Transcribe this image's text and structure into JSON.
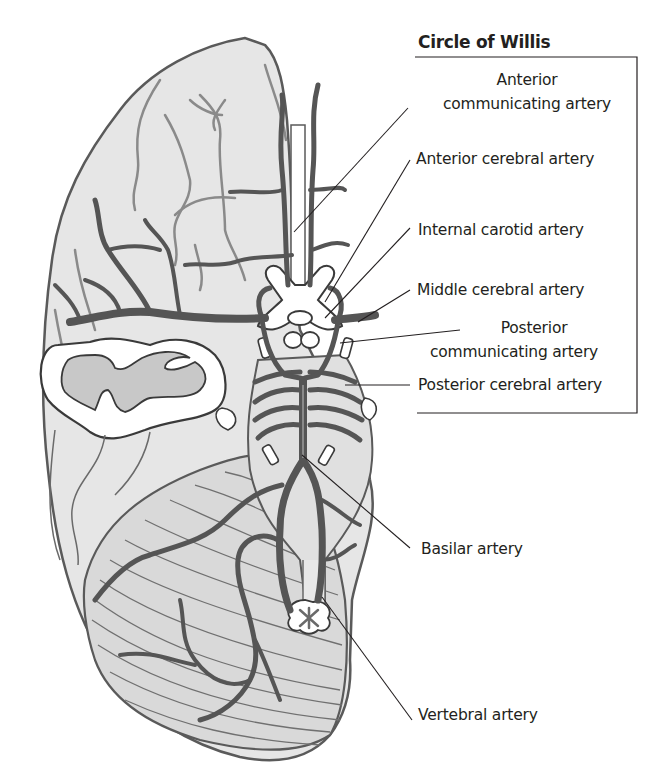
{
  "diagram": {
    "title": "Circle of Willis",
    "colors": {
      "brain_fill": "#e6e6e6",
      "brain_outline": "#5a5a5a",
      "artery_dark": "#555555",
      "artery_light": "#8a8a8a",
      "white_matter": "#ffffff",
      "gray_matter": "#c8c8c8",
      "leader_line": "#231f20"
    },
    "labels": [
      {
        "id": "anterior-communicating-artery",
        "line1": "Anterior",
        "line2": "communicating artery"
      },
      {
        "id": "anterior-cerebral-artery",
        "line1": "Anterior cerebral artery"
      },
      {
        "id": "internal-carotid-artery",
        "line1": "Internal carotid artery"
      },
      {
        "id": "middle-cerebral-artery",
        "line1": "Middle cerebral artery"
      },
      {
        "id": "posterior-communicating-artery",
        "line1": "Posterior",
        "line2": "communicating artery"
      },
      {
        "id": "posterior-cerebral-artery",
        "line1": "Posterior cerebral  artery"
      },
      {
        "id": "basilar-artery",
        "line1": "Basilar artery"
      },
      {
        "id": "vertebral-artery",
        "line1": "Vertebral artery"
      }
    ]
  }
}
